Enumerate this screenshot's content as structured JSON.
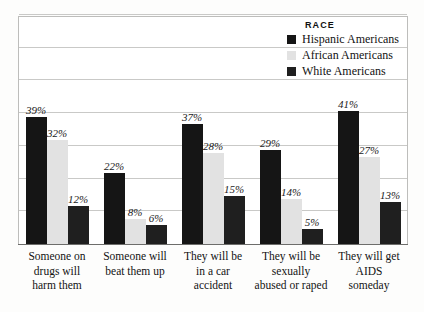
{
  "chart_data": {
    "type": "bar",
    "title": "",
    "subtitle": "",
    "xlabel": "",
    "ylabel": "",
    "ylim": [
      0,
      70
    ],
    "grid": true,
    "grid_step": 10,
    "legend_position": "top-right",
    "legend_title": "RACE",
    "value_suffix": "%",
    "categories": [
      "Someone on drugs will harm them",
      "Someone will beat them up",
      "They will be in a car accident",
      "They will be sexually abused or raped",
      "They will get AIDS someday"
    ],
    "category_lines": [
      [
        "Someone on",
        "drugs will",
        "harm them"
      ],
      [
        "Someone will",
        "beat them up"
      ],
      [
        "They will be",
        "in a car",
        "accident"
      ],
      [
        "They will be",
        "sexually",
        "abused or raped"
      ],
      [
        "They will get",
        "AIDS",
        "someday"
      ]
    ],
    "series": [
      {
        "name": "Hispanic Americans",
        "color": "#151515",
        "values": [
          39,
          22,
          37,
          29,
          41
        ],
        "labels": [
          "39%",
          "22%",
          "37%",
          "29%",
          "41%"
        ]
      },
      {
        "name": "African Americans",
        "color": "#e2e2e2",
        "values": [
          32,
          8,
          28,
          14,
          27
        ],
        "labels": [
          "32%",
          "8%",
          "28%",
          "14%",
          "27%"
        ]
      },
      {
        "name": "White Americans",
        "color": "#1f1f1f",
        "values": [
          12,
          6,
          15,
          5,
          13
        ],
        "labels": [
          "12%",
          "6%",
          "15%",
          "5%",
          "13%"
        ]
      }
    ]
  }
}
